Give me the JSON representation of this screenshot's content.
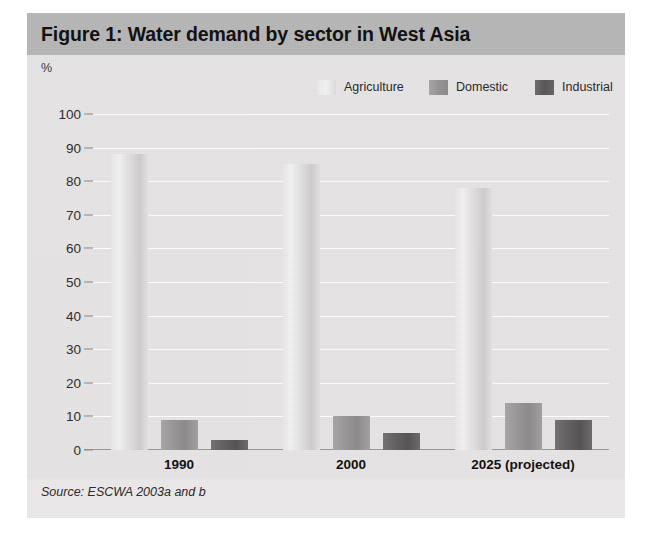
{
  "figure": {
    "title": "Figure 1: Water demand by sector in West Asia",
    "unit_label": "%",
    "source": "Source: ESCWA 2003a and b"
  },
  "colors": {
    "title_band": "#b9b8b8",
    "panel": "#e7e5e5",
    "page": "#eceaea",
    "gridline": "#ffffff",
    "agriculture": "#e3e1e1",
    "domestic": "#989696",
    "industrial": "#636161",
    "text": "#121212"
  },
  "chart_data": {
    "type": "bar",
    "title": "Figure 1: Water demand by sector in West Asia",
    "xlabel": "",
    "ylabel": "%",
    "ylim": [
      0,
      100
    ],
    "yticks": [
      0,
      10,
      20,
      30,
      40,
      50,
      60,
      70,
      80,
      90,
      100
    ],
    "ytick_labels": [
      "0",
      "10",
      "20",
      "30",
      "40",
      "50",
      "60",
      "70",
      "80",
      "90",
      "100"
    ],
    "grid": true,
    "legend_position": "top-right",
    "categories": [
      "1990",
      "2000",
      "2025 (projected)"
    ],
    "series": [
      {
        "name": "Agriculture",
        "values": [
          88,
          85,
          78
        ],
        "color": "#e3e1e1"
      },
      {
        "name": "Domestic",
        "values": [
          9,
          10,
          14
        ],
        "color": "#989696"
      },
      {
        "name": "Industrial",
        "values": [
          3,
          5,
          9
        ],
        "color": "#636161"
      }
    ],
    "annotations": [
      "Source: ESCWA 2003a and b"
    ]
  }
}
